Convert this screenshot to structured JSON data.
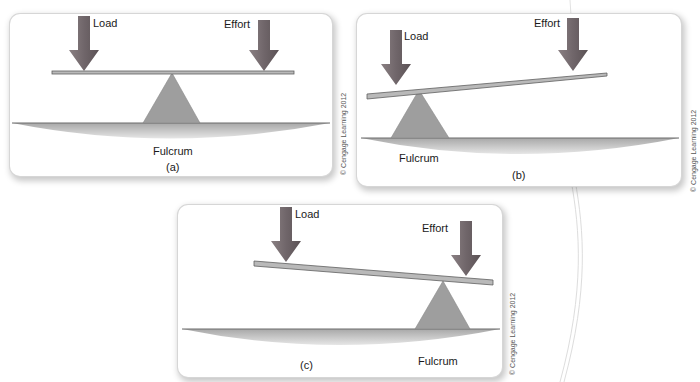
{
  "figure": {
    "copyright": "© Cengage Learning 2012",
    "colors": {
      "arrow": "#7d6f72",
      "arrow_dark": "#5e5558",
      "lever": "#b9b9b9",
      "lever_edge": "#6f6f6f",
      "fulcrum": "#9e9e9e",
      "ground": "#bdbdbd",
      "ground_line": "#6b6b6b"
    },
    "panels": [
      {
        "id": "a",
        "caption": "(a)",
        "load_label": "Load",
        "effort_label": "Effort",
        "fulcrum_label": "Fulcrum",
        "description": "First-class lever: fulcrum between load and effort"
      },
      {
        "id": "b",
        "caption": "(b)",
        "load_label": "Load",
        "effort_label": "Effort",
        "fulcrum_label": "Fulcrum",
        "description": "Second-class lever: fulcrum at left end under load"
      },
      {
        "id": "c",
        "caption": "(c)",
        "load_label": "Load",
        "effort_label": "Effort",
        "fulcrum_label": "Fulcrum",
        "description": "Third-class lever: fulcrum at right end under effort"
      }
    ]
  }
}
